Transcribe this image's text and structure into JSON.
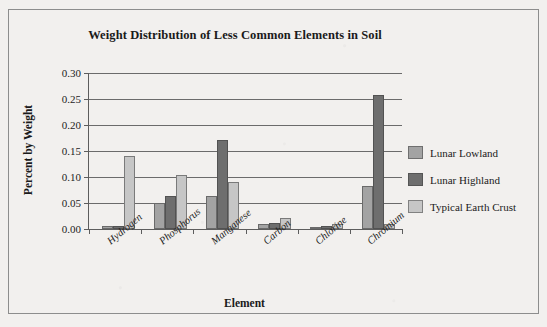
{
  "figure": {
    "border_color": "#8d8d8d",
    "background_color": "#f2f0ee"
  },
  "chart_data": {
    "type": "bar",
    "title": "Weight Distribution of Less Common Elements in Soil",
    "xlabel": "Element",
    "ylabel": "Percent by Weight",
    "categories": [
      "Hydrogen",
      "Phosphorus",
      "Manganese",
      "Carbon",
      "Chlorine",
      "Chromium"
    ],
    "series": [
      {
        "name": "Lunar Lowland",
        "color": "#a3a3a3",
        "values": [
          0.005,
          0.05,
          0.064,
          0.01,
          0.002,
          0.083
        ]
      },
      {
        "name": "Lunar Highland",
        "color": "#6e6e6e",
        "values": [
          0.005,
          0.063,
          0.171,
          0.011,
          0.005,
          0.258
        ]
      },
      {
        "name": "Typical Earth Crust",
        "color": "#c6c6c6",
        "values": [
          0.14,
          0.104,
          0.091,
          0.021,
          0.01,
          0.009
        ]
      }
    ],
    "ylim": [
      0.0,
      0.3
    ],
    "yticks": [
      0.0,
      0.05,
      0.1,
      0.15,
      0.2,
      0.25,
      0.3
    ],
    "ytick_labels": [
      "0.00",
      "0.05",
      "0.10",
      "0.15",
      "0.20",
      "0.25",
      "0.30"
    ],
    "grid": true,
    "legend_position": "right"
  }
}
